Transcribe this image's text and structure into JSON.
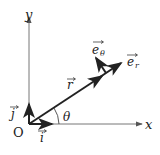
{
  "diagram": {
    "axes": {
      "x_label": "x",
      "y_label": "y",
      "origin_label": "O"
    },
    "vectors": {
      "i": "i",
      "j": "j",
      "r": "r",
      "e_r": "e",
      "e_r_sub": "r",
      "e_theta": "e",
      "e_theta_sub": "θ"
    },
    "angle_label": "θ",
    "colors": {
      "ink": "#222222",
      "axis": "#555555",
      "background": "#ffffff"
    }
  }
}
